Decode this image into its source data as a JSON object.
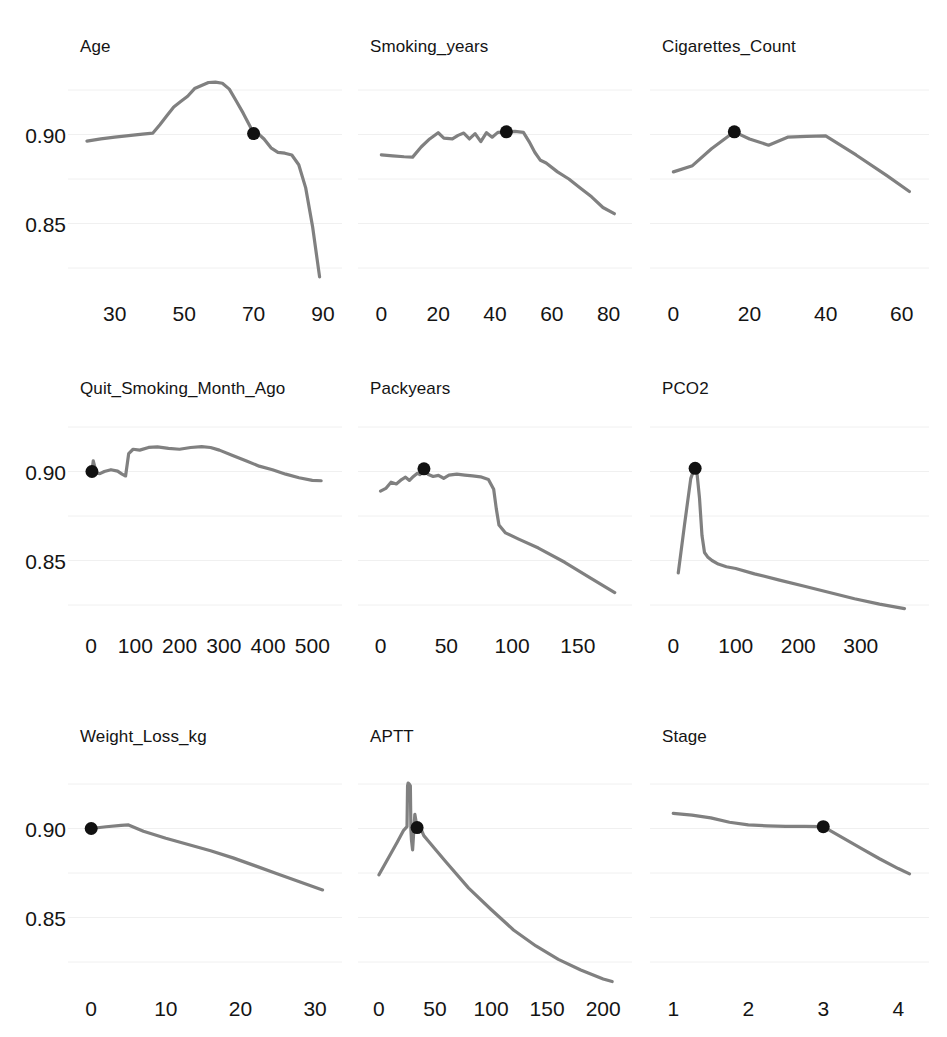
{
  "figure": {
    "background_color": "#ffffff",
    "line_color": "#808080",
    "marker_color": "#111111",
    "grid_color": "#f0f0f0",
    "text_color": "#141414",
    "rows": 3,
    "cols": 3
  },
  "chart_data": [
    {
      "type": "line",
      "title": "Age",
      "xlabel": "",
      "ylabel": "",
      "grid": true,
      "legend": "none",
      "xlim": [
        20,
        92
      ],
      "ylim": [
        0.8125,
        0.9375
      ],
      "xticks": [
        30,
        50,
        70,
        90
      ],
      "xtick_labels": [
        "30",
        "50",
        "70",
        "90"
      ],
      "yticks": [
        0.9,
        0.85
      ],
      "ytick_labels": [
        "0.90",
        "0.85"
      ],
      "gridlines_y": [
        0.925,
        0.9,
        0.875,
        0.85,
        0.825
      ],
      "marker": {
        "x": 70,
        "y": 0.9005
      },
      "x": [
        22,
        26,
        30,
        34,
        38,
        41,
        43,
        45,
        47,
        49,
        51,
        53,
        55,
        57,
        59,
        61,
        63,
        65,
        67,
        69,
        70,
        71,
        73,
        75,
        77,
        79,
        81,
        83,
        85,
        87,
        89
      ],
      "y": [
        0.8963,
        0.8975,
        0.8985,
        0.8994,
        0.9002,
        0.9008,
        0.9055,
        0.9105,
        0.9155,
        0.9185,
        0.9215,
        0.9258,
        0.9275,
        0.9292,
        0.9294,
        0.9288,
        0.9255,
        0.9188,
        0.912,
        0.9045,
        0.9005,
        0.901,
        0.8975,
        0.8925,
        0.89,
        0.8895,
        0.8885,
        0.883,
        0.87,
        0.848,
        0.82
      ]
    },
    {
      "type": "line",
      "title": "Smoking_years",
      "xlabel": "",
      "ylabel": "",
      "grid": true,
      "legend": "none",
      "xlim": [
        -4,
        84
      ],
      "ylim": [
        0.8125,
        0.9375
      ],
      "xticks": [
        0,
        20,
        40,
        60,
        80
      ],
      "xtick_labels": [
        "0",
        "20",
        "40",
        "60",
        "80"
      ],
      "yticks": [
        0.9,
        0.85
      ],
      "ytick_labels": [
        "0.90",
        "0.85"
      ],
      "gridlines_y": [
        0.925,
        0.9,
        0.875,
        0.85,
        0.825
      ],
      "marker": {
        "x": 44,
        "y": 0.9015
      },
      "x": [
        0,
        4,
        8,
        11,
        14,
        17,
        20,
        22,
        25,
        27,
        29,
        31,
        33,
        35,
        37,
        39,
        41,
        44,
        47,
        50,
        52,
        54,
        56,
        58,
        62,
        66,
        70,
        74,
        78,
        82
      ],
      "y": [
        0.8885,
        0.888,
        0.8875,
        0.8873,
        0.893,
        0.8975,
        0.901,
        0.898,
        0.8975,
        0.8995,
        0.9008,
        0.8975,
        0.9005,
        0.896,
        0.901,
        0.8985,
        0.9012,
        0.9015,
        0.9018,
        0.9012,
        0.896,
        0.89,
        0.8855,
        0.884,
        0.879,
        0.875,
        0.87,
        0.865,
        0.859,
        0.8555
      ]
    },
    {
      "type": "line",
      "title": "Cigarettes_Count",
      "xlabel": "",
      "ylabel": "",
      "grid": true,
      "legend": "none",
      "xlim": [
        -3,
        64
      ],
      "ylim": [
        0.8125,
        0.9375
      ],
      "xticks": [
        0,
        20,
        40,
        60
      ],
      "xtick_labels": [
        "0",
        "20",
        "40",
        "60"
      ],
      "yticks": [
        0.9,
        0.85
      ],
      "ytick_labels": [
        "0.90",
        "0.85"
      ],
      "gridlines_y": [
        0.925,
        0.9,
        0.875,
        0.85,
        0.825
      ],
      "marker": {
        "x": 16,
        "y": 0.9015
      },
      "x": [
        0,
        5,
        10,
        16,
        20,
        25,
        30,
        35,
        40,
        48,
        56,
        62
      ],
      "y": [
        0.879,
        0.8825,
        0.892,
        0.9015,
        0.8975,
        0.894,
        0.8985,
        0.899,
        0.8992,
        0.8885,
        0.877,
        0.868
      ]
    },
    {
      "type": "line",
      "title": "Quit_Smoking_Month_Ago",
      "xlabel": "",
      "ylabel": "",
      "grid": true,
      "legend": "none",
      "xlim": [
        -25,
        540
      ],
      "ylim": [
        0.8125,
        0.9375
      ],
      "xticks": [
        0,
        100,
        200,
        300,
        400,
        500
      ],
      "xtick_labels": [
        "0",
        "100",
        "200",
        "300",
        "400",
        "500"
      ],
      "yticks": [
        0.9,
        0.85
      ],
      "ytick_labels": [
        "0.90",
        "0.85"
      ],
      "gridlines_y": [
        0.925,
        0.9,
        0.875,
        0.85,
        0.825
      ],
      "marker": {
        "x": 2,
        "y": 0.9
      },
      "x": [
        0,
        2,
        5,
        8,
        12,
        20,
        30,
        45,
        60,
        70,
        78,
        85,
        95,
        110,
        130,
        150,
        175,
        200,
        225,
        250,
        270,
        290,
        320,
        350,
        380,
        410,
        440,
        470,
        500,
        520
      ],
      "y": [
        0.9012,
        0.9,
        0.906,
        0.903,
        0.899,
        0.8988,
        0.9,
        0.901,
        0.9002,
        0.8985,
        0.8975,
        0.91,
        0.9125,
        0.912,
        0.9135,
        0.9138,
        0.913,
        0.9125,
        0.9135,
        0.914,
        0.9135,
        0.912,
        0.909,
        0.906,
        0.903,
        0.901,
        0.8985,
        0.8965,
        0.895,
        0.8948
      ]
    },
    {
      "type": "line",
      "title": "Packyears",
      "xlabel": "",
      "ylabel": "",
      "grid": true,
      "legend": "none",
      "xlim": [
        -8,
        182
      ],
      "ylim": [
        0.8125,
        0.9375
      ],
      "xticks": [
        0,
        50,
        100,
        150
      ],
      "xtick_labels": [
        "0",
        "50",
        "100",
        "150"
      ],
      "yticks": [
        0.9,
        0.85
      ],
      "ytick_labels": [
        "0.90",
        "0.85"
      ],
      "gridlines_y": [
        0.925,
        0.9,
        0.875,
        0.85,
        0.825
      ],
      "marker": {
        "x": 33,
        "y": 0.9015
      },
      "x": [
        0,
        4,
        8,
        12,
        16,
        19,
        22,
        25,
        28,
        30,
        33,
        36,
        40,
        44,
        48,
        52,
        58,
        64,
        70,
        76,
        82,
        86,
        88,
        90,
        95,
        105,
        120,
        140,
        160,
        178
      ],
      "y": [
        0.889,
        0.8905,
        0.894,
        0.893,
        0.8955,
        0.8968,
        0.895,
        0.8972,
        0.899,
        0.8982,
        0.9015,
        0.8985,
        0.8972,
        0.8978,
        0.8962,
        0.898,
        0.8985,
        0.898,
        0.8975,
        0.897,
        0.8955,
        0.89,
        0.879,
        0.87,
        0.8655,
        0.862,
        0.857,
        0.849,
        0.84,
        0.832
      ]
    },
    {
      "type": "line",
      "title": "PCO2",
      "xlabel": "",
      "ylabel": "",
      "grid": true,
      "legend": "none",
      "xlim": [
        -18,
        390
      ],
      "ylim": [
        0.8125,
        0.9375
      ],
      "xticks": [
        0,
        100,
        200,
        300
      ],
      "xtick_labels": [
        "0",
        "100",
        "200",
        "300"
      ],
      "yticks": [
        0.9,
        0.85
      ],
      "ytick_labels": [
        "0.90",
        "0.85"
      ],
      "gridlines_y": [
        0.925,
        0.9,
        0.875,
        0.85,
        0.825
      ],
      "marker": {
        "x": 35,
        "y": 0.9018
      },
      "x": [
        8,
        18,
        28,
        33,
        35,
        38,
        42,
        46,
        50,
        55,
        62,
        72,
        85,
        100,
        130,
        170,
        210,
        250,
        290,
        330,
        370
      ],
      "y": [
        0.843,
        0.87,
        0.896,
        0.901,
        0.9018,
        0.899,
        0.885,
        0.864,
        0.8545,
        0.852,
        0.85,
        0.848,
        0.8465,
        0.8455,
        0.8425,
        0.839,
        0.8355,
        0.832,
        0.8285,
        0.8255,
        0.823
      ]
    },
    {
      "type": "line",
      "title": "Weight_Loss_kg",
      "xlabel": "",
      "ylabel": "",
      "grid": true,
      "legend": "none",
      "xlim": [
        -1.5,
        32
      ],
      "ylim": [
        0.8125,
        0.9375
      ],
      "xticks": [
        0,
        10,
        20,
        30
      ],
      "xtick_labels": [
        "0",
        "10",
        "20",
        "30"
      ],
      "yticks": [
        0.9,
        0.85
      ],
      "ytick_labels": [
        "0.90",
        "0.85"
      ],
      "gridlines_y": [
        0.925,
        0.9,
        0.875,
        0.85,
        0.825
      ],
      "marker": {
        "x": 0,
        "y": 0.9
      },
      "x": [
        0,
        2,
        4,
        5,
        7,
        10,
        13,
        16,
        19,
        22,
        25,
        28,
        31
      ],
      "y": [
        0.9,
        0.901,
        0.9018,
        0.902,
        0.8985,
        0.8945,
        0.891,
        0.8875,
        0.8835,
        0.879,
        0.8745,
        0.87,
        0.8655
      ]
    },
    {
      "type": "line",
      "title": "APTT",
      "xlabel": "",
      "ylabel": "",
      "grid": true,
      "legend": "none",
      "xlim": [
        -8,
        215
      ],
      "ylim": [
        0.8125,
        0.9375
      ],
      "xticks": [
        0,
        50,
        100,
        150,
        200
      ],
      "xtick_labels": [
        "0",
        "50",
        "100",
        "150",
        "200"
      ],
      "yticks": [
        0.9,
        0.85
      ],
      "ytick_labels": [
        "0.90",
        "0.85"
      ],
      "gridlines_y": [
        0.925,
        0.9,
        0.875,
        0.85,
        0.825
      ],
      "marker": {
        "x": 34,
        "y": 0.9005
      },
      "x": [
        0,
        8,
        16,
        22,
        25,
        25.5,
        26,
        27,
        28,
        28.5,
        29,
        30,
        31,
        32,
        34,
        36,
        38,
        40,
        44,
        50,
        60,
        80,
        100,
        120,
        140,
        160,
        180,
        200,
        208
      ],
      "y": [
        0.874,
        0.883,
        0.892,
        0.899,
        0.901,
        0.924,
        0.9255,
        0.925,
        0.924,
        0.899,
        0.8935,
        0.888,
        0.898,
        0.908,
        0.9005,
        0.9,
        0.899,
        0.896,
        0.893,
        0.8885,
        0.881,
        0.8665,
        0.8545,
        0.843,
        0.834,
        0.8265,
        0.8205,
        0.8155,
        0.814
      ]
    },
    {
      "type": "line",
      "title": "Stage",
      "xlabel": "",
      "ylabel": "",
      "grid": true,
      "legend": "none",
      "xlim": [
        0.85,
        4.25
      ],
      "ylim": [
        0.8125,
        0.9375
      ],
      "xticks": [
        1,
        2,
        3,
        4
      ],
      "xtick_labels": [
        "1",
        "2",
        "3",
        "4"
      ],
      "yticks": [
        0.9,
        0.85
      ],
      "ytick_labels": [
        "0.90",
        "0.85"
      ],
      "gridlines_y": [
        0.925,
        0.9,
        0.875,
        0.85,
        0.825
      ],
      "marker": {
        "x": 3,
        "y": 0.901
      },
      "x": [
        1.0,
        1.25,
        1.5,
        1.75,
        2.0,
        2.25,
        2.5,
        2.75,
        3.0,
        3.25,
        3.5,
        3.75,
        4.0,
        4.15
      ],
      "y": [
        0.9085,
        0.9075,
        0.906,
        0.9035,
        0.902,
        0.9015,
        0.9012,
        0.9012,
        0.901,
        0.895,
        0.889,
        0.883,
        0.8775,
        0.8745
      ]
    }
  ]
}
